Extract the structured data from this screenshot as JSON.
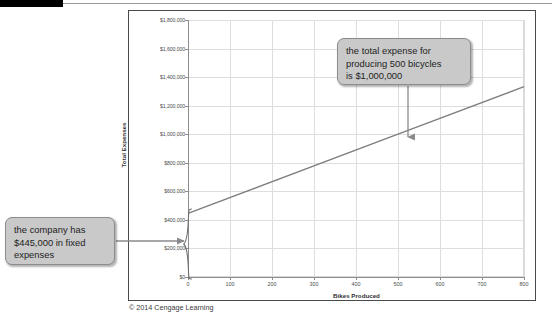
{
  "page": {
    "credit": "© 2014 Cengage Learning"
  },
  "chart_data": {
    "type": "line",
    "title": "",
    "xlabel": "Bikes Produced",
    "ylabel": "Total Expenses",
    "xlim": [
      0,
      800
    ],
    "ylim": [
      0,
      1800000
    ],
    "grid": true,
    "legend": "none",
    "x_ticks": [
      0,
      100,
      200,
      300,
      400,
      500,
      600,
      700,
      800
    ],
    "x_tick_labels": [
      "0",
      "100",
      "200",
      "300",
      "400",
      "500",
      "600",
      "700",
      "800"
    ],
    "y_ticks": [
      0,
      200000,
      400000,
      600000,
      800000,
      1000000,
      1200000,
      1400000,
      1600000,
      1800000
    ],
    "y_tick_labels": [
      "$0",
      "$200,000",
      "$400,000",
      "$600,000",
      "$800,000",
      "$1,000,000",
      "$1,200,000",
      "$1,400,000",
      "$1,600,000",
      "$1,800,000"
    ],
    "series": [
      {
        "name": "Total Expenses",
        "x": [
          0,
          500,
          800
        ],
        "values": [
          445000,
          1000000,
          1333000
        ],
        "color": "#7d7d7d",
        "fixed_cost": 445000,
        "variable_cost_per_unit": 1110
      }
    ],
    "annotations": [
      {
        "id": "total-expense-callout",
        "text": "the total expense for producing 500 bicycles is $1,000,000",
        "lines": [
          "the total expense for",
          "producing 500 bicycles",
          "is $1,000,000"
        ],
        "points_to": {
          "x": 500,
          "y": 1000000
        }
      },
      {
        "id": "fixed-expense-callout",
        "text": "the company has $445,000 in fixed expenses",
        "lines": [
          "the company has",
          "$445,000 in fixed",
          "expenses"
        ],
        "points_to": {
          "x": 0,
          "y": 222500
        },
        "brace_range": [
          0,
          445000
        ]
      }
    ]
  },
  "colors": {
    "line": "#7d7d7d",
    "grid": "#dedede",
    "axis": "#8d8d8d",
    "callout_fill": "#c9c9c9",
    "callout_border": "#8c8c8c",
    "panel_border": "#4a4a4a",
    "top_bar": "#000000"
  }
}
